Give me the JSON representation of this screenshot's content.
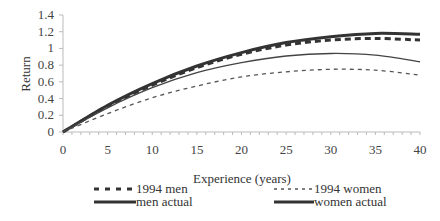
{
  "chart_data": {
    "type": "line",
    "title": "",
    "xlabel": "Experience (years)",
    "ylabel": "Return",
    "xlim": [
      0,
      40
    ],
    "ylim": [
      0,
      1.4
    ],
    "x_ticks": [
      0,
      5,
      10,
      15,
      20,
      25,
      30,
      35,
      40
    ],
    "y_ticks": [
      0,
      0.2,
      0.4,
      0.6,
      0.8,
      1,
      1.2,
      1.4
    ],
    "y_tick_labels": [
      "0",
      "0.2",
      "0.4",
      "0.6",
      "0.8",
      "1",
      "1.2",
      "1.4"
    ],
    "grid": false,
    "legend_position": "bottom",
    "x": [
      0,
      5,
      10,
      15,
      20,
      25,
      30,
      35,
      40
    ],
    "series": [
      {
        "name": "1994 men",
        "style": "dashed-thick",
        "values": [
          0,
          0.31,
          0.56,
          0.77,
          0.93,
          1.04,
          1.1,
          1.12,
          1.1
        ]
      },
      {
        "name": "men actual",
        "style": "solid-thick",
        "values": [
          0,
          0.32,
          0.58,
          0.79,
          0.95,
          1.07,
          1.14,
          1.18,
          1.17
        ]
      },
      {
        "name": "1994 women",
        "style": "dotted",
        "values": [
          0,
          0.22,
          0.41,
          0.55,
          0.66,
          0.72,
          0.75,
          0.74,
          0.68
        ]
      },
      {
        "name": "women actual",
        "style": "solid-thin",
        "values": [
          0,
          0.29,
          0.53,
          0.71,
          0.83,
          0.91,
          0.94,
          0.92,
          0.84
        ]
      }
    ]
  },
  "legend": {
    "items": [
      {
        "label": "1994 men"
      },
      {
        "label": "men actual"
      },
      {
        "label": "1994 women"
      },
      {
        "label": "women actual"
      }
    ]
  },
  "axes": {
    "xlabel": "Experience (years)",
    "ylabel": "Return"
  }
}
